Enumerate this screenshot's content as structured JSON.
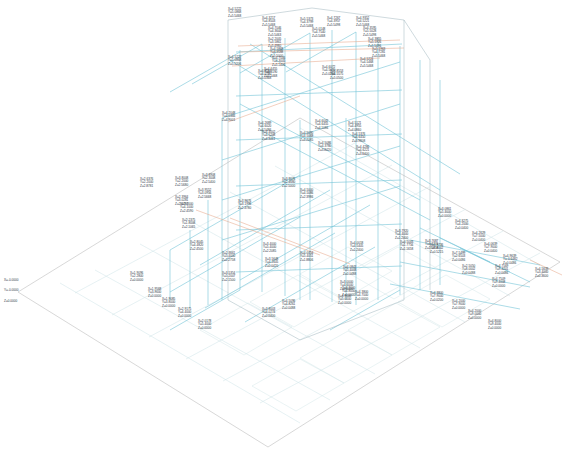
{
  "view": {
    "title": "3D Model Node Coordinates",
    "projection": "isometric",
    "background_color": "#ffffff",
    "label_color": "#2a3340",
    "member_color": "#6fc4d4",
    "grid_color": "#cfe2e6",
    "boundary_color": "#b9b9b9",
    "accent_color": "#e8a583",
    "label_format": "X= / Y= / Z="
  },
  "axis_keys": {
    "x": "X=",
    "y": "Y=",
    "z": "Z="
  },
  "origin_label": {
    "x": "X=-0.0000",
    "y": "Y=-0.0000",
    "z": "Z=0.0000"
  },
  "chart_data": {
    "type": "scatter",
    "xlabel": "X",
    "ylabel": "Y",
    "zlabel": "Z",
    "xlim": [
      0,
      10
    ],
    "ylim": [
      0,
      10
    ],
    "zlim": [
      0,
      6
    ],
    "grid": true,
    "legend": "none",
    "nodes": [
      {
        "x": "4.5222",
        "y": "5.0868",
        "z": "5.5468",
        "px": 228,
        "py": 8
      },
      {
        "x": "4.3217",
        "y": "4.8503",
        "z": "5.5468",
        "px": 262,
        "py": 17
      },
      {
        "x": "4.7046",
        "y": "4.3644",
        "z": "5.5463",
        "px": 268,
        "py": 27
      },
      {
        "x": "5.5373",
        "y": "4.3799",
        "z": "5.5468",
        "px": 300,
        "py": 18
      },
      {
        "x": "4.7267",
        "y": "4.3957",
        "z": "5.5498",
        "px": 327,
        "py": 17
      },
      {
        "x": "4.9352",
        "y": "4.5221",
        "z": "5.5468",
        "px": 356,
        "py": 17
      },
      {
        "x": "5.0148",
        "y": "4.7540",
        "z": "5.5468",
        "px": 312,
        "py": 28
      },
      {
        "x": "2.2005",
        "y": "3.5861",
        "z": "5.4980",
        "px": 268,
        "py": 38
      },
      {
        "x": "4.5868",
        "y": "4.5588",
        "z": "5.5000",
        "px": 270,
        "py": 48
      },
      {
        "x": "4.3595",
        "y": "5.5028",
        "z": "5.5498",
        "px": 363,
        "py": 27
      },
      {
        "x": "4.3855",
        "y": "5.5926",
        "z": "5.5496",
        "px": 368,
        "py": 38
      },
      {
        "x": "5.1963",
        "y": "4.7281",
        "z": "5.5468",
        "px": 372,
        "py": 48
      },
      {
        "x": "4.5224",
        "y": "4.5468",
        "z": "5.5468",
        "px": 360,
        "py": 58
      },
      {
        "x": "4.5222",
        "y": "5.0868",
        "z": "5.5206",
        "px": 228,
        "py": 56
      },
      {
        "x": "4.7046",
        "y": "4.3005",
        "z": "5.1406",
        "px": 272,
        "py": 57
      },
      {
        "x": "4.6455",
        "y": "4.3190",
        "z": "5.1468",
        "px": 264,
        "py": 68
      },
      {
        "x": "4.8564",
        "y": "4.0280",
        "z": "5.0368",
        "px": 258,
        "py": 70
      },
      {
        "x": "4.6072",
        "y": "4.5090",
        "z": "5.0286",
        "px": 322,
        "py": 66
      },
      {
        "x": "4.8553",
        "y": "4.5575",
        "z": "5.0500",
        "px": 330,
        "py": 70
      },
      {
        "x": "4.2048",
        "y": "4.0366",
        "z": "4.9001",
        "px": 222,
        "py": 112
      },
      {
        "x": "4.2689",
        "y": "4.6020",
        "z": "4.5486",
        "px": 258,
        "py": 122
      },
      {
        "x": "4.4002",
        "y": "4.5208",
        "z": "4.3461",
        "px": 262,
        "py": 131
      },
      {
        "x": "4.5090",
        "y": "4.5068",
        "z": "4.2085",
        "px": 300,
        "py": 132
      },
      {
        "x": "4.6042",
        "y": "4.6455",
        "z": "4.1086",
        "px": 315,
        "py": 120
      },
      {
        "x": "4.5121",
        "y": "4.4955",
        "z": "4.0860",
        "px": 348,
        "py": 122
      },
      {
        "x": "4.5376",
        "y": "4.6450",
        "z": "3.9808",
        "px": 352,
        "py": 133
      },
      {
        "x": "4.5086",
        "y": "4.3780",
        "z": "3.8420",
        "px": 318,
        "py": 142
      },
      {
        "x": "4.4286",
        "y": "4.6221",
        "z": "3.6400",
        "px": 356,
        "py": 146
      },
      {
        "x": "3.8008",
        "y": "2.2000",
        "z": "2.5680",
        "px": 175,
        "py": 177
      },
      {
        "x": "3.8908",
        "y": "2.3008",
        "z": "2.5400",
        "px": 202,
        "py": 174
      },
      {
        "x": "2.6376",
        "y": "2.2000",
        "z": "2.8781",
        "px": 140,
        "py": 178
      },
      {
        "x": "3.9552",
        "y": "3.0956",
        "z": "2.5668",
        "px": 198,
        "py": 189
      },
      {
        "x": "3.9076",
        "y": "2.4680",
        "z": "2.5000",
        "px": 282,
        "py": 178
      },
      {
        "x": "2.3964",
        "y": "3.0281",
        "z": "2.4780",
        "px": 175,
        "py": 196
      },
      {
        "x": "4.5000",
        "y": "4.5086",
        "z": "2.3986",
        "px": 300,
        "py": 189
      },
      {
        "x": "2.7000",
        "y": "4.1000",
        "z": "2.4590",
        "px": 180,
        "py": 203
      },
      {
        "x": "3.9676",
        "y": "3.1996",
        "z": "2.3780",
        "px": 238,
        "py": 200
      },
      {
        "x": "2.2375",
        "y": "1.8008",
        "z": "2.1065",
        "px": 182,
        "py": 219
      },
      {
        "x": "2.8045",
        "y": "4.4820",
        "z": "2.4500",
        "px": 190,
        "py": 241
      },
      {
        "x": "2.3661",
        "y": "5.4000",
        "z": "2.2758",
        "px": 222,
        "py": 252
      },
      {
        "x": "3.4000",
        "y": "5.4000",
        "z": "2.2085",
        "px": 263,
        "py": 243
      },
      {
        "x": "3.5648",
        "y": "4.2605",
        "z": "0.0420",
        "px": 265,
        "py": 258
      },
      {
        "x": "3.5354",
        "y": "5.2007",
        "z": "2.1500",
        "px": 222,
        "py": 272
      },
      {
        "x": "4.0454",
        "y": "5.4051",
        "z": "1.8806",
        "px": 300,
        "py": 252
      },
      {
        "x": "4.0018",
        "y": "4.5405",
        "z": "1.2400",
        "px": 350,
        "py": 242
      },
      {
        "x": "3.7920",
        "y": "4.4000",
        "z": "1.2400",
        "px": 395,
        "py": 230
      },
      {
        "x": "4.5043",
        "y": "1.7756",
        "z": "1.1658",
        "px": 400,
        "py": 241
      },
      {
        "x": "3.7687",
        "y": "4.3774",
        "z": "1.1808",
        "px": 425,
        "py": 240
      },
      {
        "x": "4.0843",
        "y": "5.4008",
        "z": "0.0488",
        "px": 343,
        "py": 266
      },
      {
        "x": "3.0000",
        "y": "4.6000",
        "z": "0.0000",
        "px": 340,
        "py": 281
      },
      {
        "x": "4.3000",
        "y": "4.8000",
        "z": "0.0000",
        "px": 342,
        "py": 287
      },
      {
        "x": "4.3000",
        "y": "5.0000",
        "z": "0.0000",
        "px": 338,
        "py": 295
      },
      {
        "x": "4.3800",
        "y": "4.7000",
        "z": "0.0000",
        "px": 355,
        "py": 291
      },
      {
        "x": "4.5096",
        "y": "4.8261",
        "z": "0.0488",
        "px": 282,
        "py": 300
      },
      {
        "x": "3.8003",
        "y": "4.0274",
        "z": "0.0400",
        "px": 262,
        "py": 308
      },
      {
        "x": "1.9096",
        "y": "2.2800",
        "z": "0.0000",
        "px": 130,
        "py": 272
      },
      {
        "x": "1.9568",
        "y": "3.9000",
        "z": "0.0000",
        "px": 148,
        "py": 288
      },
      {
        "x": "1.9085",
        "y": "3.8000",
        "z": "0.0000",
        "px": 162,
        "py": 298
      },
      {
        "x": "2.9175",
        "y": "4.4000",
        "z": "0.0000",
        "px": 178,
        "py": 308
      },
      {
        "x": "2.0178",
        "y": "5.4000",
        "z": "0.0000",
        "px": 198,
        "py": 320
      },
      {
        "x": "3.0861",
        "y": "5.4000",
        "z": "0.0000",
        "px": 438,
        "py": 208
      },
      {
        "x": "4.3275",
        "y": "4.2000",
        "z": "0.0400",
        "px": 455,
        "py": 220
      },
      {
        "x": "4.2629",
        "y": "7.5000",
        "z": "0.0400",
        "px": 472,
        "py": 232
      },
      {
        "x": "4.9736",
        "y": "7.8002",
        "z": "0.5215",
        "px": 430,
        "py": 244
      },
      {
        "x": "4.0639",
        "y": "7.9000",
        "z": "0.0400",
        "px": 484,
        "py": 243
      },
      {
        "x": "7.5499",
        "y": "2.6503",
        "z": "0.0486",
        "px": 452,
        "py": 252
      },
      {
        "x": "4.9639",
        "y": "-0.6482",
        "z": "0.0486",
        "px": 503,
        "py": 255
      },
      {
        "x": "2.5050",
        "y": "8.0002",
        "z": "0.0488",
        "px": 462,
        "py": 265
      },
      {
        "x": "4.7569",
        "y": "9.4201",
        "z": "0.0486",
        "px": 495,
        "py": 265
      },
      {
        "x": "4.5639",
        "y": "3.4000",
        "z": "0.3600",
        "px": 535,
        "py": 268
      },
      {
        "x": "4.7509",
        "y": "9.4008",
        "z": "0.0000",
        "px": 492,
        "py": 278
      },
      {
        "x": "4.3800",
        "y": "7.9000",
        "z": "0.0200",
        "px": 430,
        "py": 292
      },
      {
        "x": "4.2000",
        "y": "7.9000",
        "z": "0.0000",
        "px": 452,
        "py": 300
      },
      {
        "x": "4.2000",
        "y": "9.0000",
        "z": "0.0000",
        "px": 468,
        "py": 310
      },
      {
        "x": "4.8000",
        "y": "9.4000",
        "z": "0.0000",
        "px": 488,
        "py": 320
      }
    ]
  }
}
